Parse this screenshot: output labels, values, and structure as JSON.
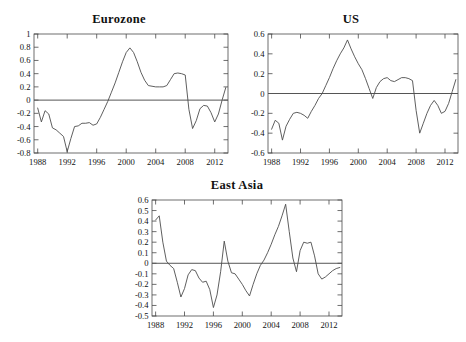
{
  "figure": {
    "background": "#ffffff",
    "line_color": "#4d4d4d",
    "axis_color": "#4a4a4a",
    "text_color": "#111111"
  },
  "chart_data": [
    {
      "type": "line",
      "title": "Eurozone",
      "xlabel": "",
      "ylabel": "",
      "xlim": [
        1987.5,
        2013.8
      ],
      "ylim": [
        -0.8,
        1.0
      ],
      "grid": false,
      "legend": "none",
      "xticks": [
        1988,
        1992,
        1996,
        2000,
        2004,
        2008,
        2012
      ],
      "xtick_labels": [
        "1988",
        "1992",
        "1996",
        "2000",
        "2004",
        "2008",
        "2012"
      ],
      "yticks": [
        1,
        0.8,
        0.6,
        0.4,
        0.2,
        0,
        -0.2,
        -0.4,
        -0.6,
        -0.8
      ],
      "ytick_labels": [
        "1",
        "0.8",
        "0.6",
        "0.4",
        "0.2",
        "0",
        "-0.2",
        "-0.4",
        "-0.6",
        "-0.8"
      ],
      "zero_line": 0,
      "x": [
        1988,
        1988.5,
        1989,
        1989.5,
        1990,
        1990.5,
        1991,
        1991.5,
        1992,
        1992.5,
        1993,
        1993.5,
        1994,
        1994.5,
        1995,
        1995.5,
        1996,
        1996.5,
        1997,
        1997.5,
        1998,
        1998.5,
        1999,
        1999.5,
        2000,
        2000.5,
        2001,
        2001.5,
        2002,
        2002.5,
        2003,
        2003.5,
        2004,
        2004.5,
        2005,
        2005.5,
        2006,
        2006.5,
        2007,
        2007.5,
        2008,
        2008.5,
        2009,
        2009.5,
        2010,
        2010.5,
        2011,
        2011.5,
        2012,
        2012.5,
        2013,
        2013.5
      ],
      "values": [
        -0.12,
        -0.33,
        -0.16,
        -0.21,
        -0.42,
        -0.45,
        -0.5,
        -0.55,
        -0.78,
        -0.58,
        -0.4,
        -0.39,
        -0.35,
        -0.35,
        -0.34,
        -0.38,
        -0.36,
        -0.26,
        -0.14,
        -0.02,
        0.12,
        0.26,
        0.42,
        0.58,
        0.72,
        0.79,
        0.72,
        0.58,
        0.42,
        0.3,
        0.22,
        0.21,
        0.2,
        0.2,
        0.2,
        0.22,
        0.31,
        0.4,
        0.41,
        0.4,
        0.38,
        -0.14,
        -0.43,
        -0.31,
        -0.13,
        -0.08,
        -0.09,
        -0.19,
        -0.33,
        -0.21,
        0.0,
        0.19
      ]
    },
    {
      "type": "line",
      "title": "US",
      "xlabel": "",
      "ylabel": "",
      "xlim": [
        1987.5,
        2013.8
      ],
      "ylim": [
        -0.6,
        0.6
      ],
      "grid": false,
      "legend": "none",
      "xticks": [
        1988,
        1992,
        1996,
        2000,
        2004,
        2008,
        2012
      ],
      "xtick_labels": [
        "1988",
        "1992",
        "1996",
        "2000",
        "2004",
        "2008",
        "2012"
      ],
      "yticks": [
        0.6,
        0.4,
        0.2,
        0,
        -0.2,
        -0.4,
        -0.6
      ],
      "ytick_labels": [
        "0.6",
        "0.4",
        "0.2",
        "0",
        "-0.2",
        "-0.4",
        "-0.6"
      ],
      "zero_line": 0,
      "x": [
        1988,
        1988.5,
        1989,
        1989.5,
        1990,
        1990.5,
        1991,
        1991.5,
        1992,
        1992.5,
        1993,
        1993.5,
        1994,
        1994.5,
        1995,
        1995.5,
        1996,
        1996.5,
        1997,
        1997.5,
        1998,
        1998.5,
        1999,
        1999.5,
        2000,
        2000.5,
        2001,
        2001.5,
        2002,
        2002.5,
        2003,
        2003.5,
        2004,
        2004.5,
        2005,
        2005.5,
        2006,
        2006.5,
        2007,
        2007.5,
        2008,
        2008.5,
        2009,
        2009.5,
        2010,
        2010.5,
        2011,
        2011.5,
        2012,
        2012.5,
        2013,
        2013.5
      ],
      "values": [
        -0.36,
        -0.27,
        -0.3,
        -0.47,
        -0.33,
        -0.26,
        -0.2,
        -0.19,
        -0.2,
        -0.22,
        -0.25,
        -0.18,
        -0.12,
        -0.05,
        0.0,
        0.08,
        0.16,
        0.25,
        0.33,
        0.4,
        0.46,
        0.54,
        0.45,
        0.37,
        0.3,
        0.24,
        0.15,
        0.05,
        -0.05,
        0.06,
        0.12,
        0.15,
        0.16,
        0.13,
        0.12,
        0.14,
        0.16,
        0.16,
        0.15,
        0.13,
        -0.17,
        -0.4,
        -0.3,
        -0.2,
        -0.12,
        -0.07,
        -0.12,
        -0.2,
        -0.18,
        -0.1,
        0.02,
        0.14
      ]
    },
    {
      "type": "line",
      "title": "East Asia",
      "xlabel": "",
      "ylabel": "",
      "xlim": [
        1987.5,
        2013.8
      ],
      "ylim": [
        -0.5,
        0.6
      ],
      "grid": false,
      "legend": "none",
      "xticks": [
        1988,
        1992,
        1996,
        2000,
        2004,
        2008,
        2012
      ],
      "xtick_labels": [
        "1988",
        "1992",
        "1996",
        "2000",
        "2004",
        "2008",
        "2012"
      ],
      "yticks": [
        0.6,
        0.5,
        0.4,
        0.3,
        0.2,
        0.1,
        0,
        -0.1,
        -0.2,
        -0.3,
        -0.4,
        -0.5
      ],
      "ytick_labels": [
        "0.6",
        "0.5",
        "0.4",
        "0.3",
        "0.2",
        "0.1",
        "0",
        "-0.1",
        "-0.2",
        "-0.3",
        "-0.4",
        "-0.5"
      ],
      "zero_line": 0,
      "x": [
        1988,
        1988.5,
        1989,
        1989.5,
        1990,
        1990.5,
        1991,
        1991.5,
        1992,
        1992.5,
        1993,
        1993.5,
        1994,
        1994.5,
        1995,
        1995.5,
        1996,
        1996.5,
        1997,
        1997.5,
        1998,
        1998.5,
        1999,
        1999.5,
        2000,
        2000.5,
        2001,
        2001.5,
        2002,
        2002.5,
        2003,
        2003.5,
        2004,
        2004.5,
        2005,
        2005.5,
        2006,
        2006.5,
        2007,
        2007.5,
        2008,
        2008.5,
        2009,
        2009.5,
        2010,
        2010.5,
        2011,
        2011.5,
        2012,
        2012.5,
        2013,
        2013.5
      ],
      "values": [
        0.41,
        0.45,
        0.2,
        0.02,
        -0.02,
        -0.05,
        -0.18,
        -0.32,
        -0.24,
        -0.11,
        -0.06,
        -0.07,
        -0.14,
        -0.18,
        -0.17,
        -0.25,
        -0.42,
        -0.3,
        -0.08,
        0.21,
        0.02,
        -0.09,
        -0.1,
        -0.15,
        -0.2,
        -0.26,
        -0.31,
        -0.2,
        -0.1,
        -0.02,
        0.03,
        0.1,
        0.18,
        0.27,
        0.35,
        0.45,
        0.56,
        0.3,
        0.05,
        -0.08,
        0.12,
        0.2,
        0.19,
        0.2,
        0.07,
        -0.1,
        -0.15,
        -0.13,
        -0.1,
        -0.07,
        -0.05,
        -0.04
      ]
    }
  ]
}
